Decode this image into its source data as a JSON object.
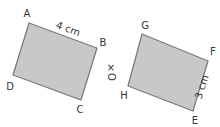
{
  "figure": {
    "left_shape": {
      "vertices": [
        {
          "name": "A",
          "x": 29,
          "y": 23,
          "label_x": 27,
          "label_y": 17
        },
        {
          "name": "B",
          "x": 97,
          "y": 48,
          "label_x": 103,
          "label_y": 46
        },
        {
          "name": "C",
          "x": 81,
          "y": 100,
          "label_x": 80,
          "label_y": 113
        },
        {
          "name": "D",
          "x": 13,
          "y": 75,
          "label_x": 10,
          "label_y": 90
        }
      ],
      "side_label": {
        "text": "4 cm",
        "side": "AB",
        "x": 67,
        "y": 32,
        "rotate": 20
      }
    },
    "right_shape": {
      "vertices": [
        {
          "name": "G",
          "x": 142,
          "y": 34,
          "label_x": 145,
          "label_y": 29
        },
        {
          "name": "F",
          "x": 208,
          "y": 61,
          "label_x": 213,
          "label_y": 55
        },
        {
          "name": "E",
          "x": 193,
          "y": 111,
          "label_x": 195,
          "label_y": 124
        },
        {
          "name": "H",
          "x": 128,
          "y": 86,
          "label_x": 124,
          "label_y": 99
        }
      ],
      "side_label": {
        "text": "3 cm",
        "side": "FE",
        "x": 205,
        "y": 88,
        "rotate": -72
      }
    },
    "center": {
      "marker": "×",
      "label": "O",
      "x": 111,
      "y": 71
    }
  },
  "colors": {
    "fill": "#c8c8c8",
    "stroke": "#777777",
    "text": "#333333"
  }
}
